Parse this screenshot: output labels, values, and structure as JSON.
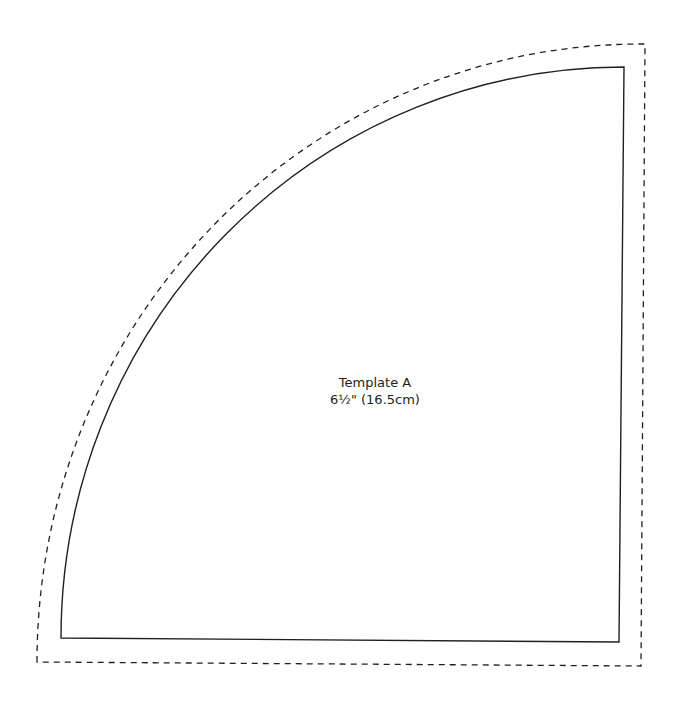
{
  "template": {
    "title": "Template A",
    "size": "6½\" (16.5cm)"
  },
  "shapes": {
    "cut_line": {
      "style": "solid",
      "color": "#231f20"
    },
    "seam_allowance_line": {
      "style": "dashed",
      "color": "#231f20"
    }
  }
}
